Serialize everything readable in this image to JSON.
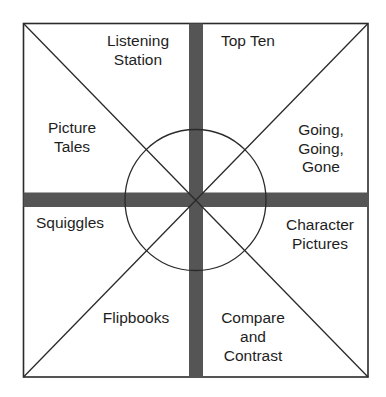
{
  "diagram": {
    "type": "activity-wheel",
    "colors": {
      "background": "#ffffff",
      "outline": "#2a2a2a",
      "cross_bar": "#555555",
      "text": "#1e1e1e"
    },
    "sections": [
      {
        "id": "top-left-upper",
        "lines": [
          "Listening",
          "Station"
        ]
      },
      {
        "id": "top-right-upper",
        "lines": [
          "Top Ten"
        ]
      },
      {
        "id": "top-left-lower",
        "lines": [
          "Picture",
          "Tales"
        ]
      },
      {
        "id": "top-right-lower",
        "lines": [
          "Going,",
          "Going,",
          "Gone"
        ]
      },
      {
        "id": "bottom-left-upper",
        "lines": [
          "Squiggles"
        ]
      },
      {
        "id": "bottom-right-upper",
        "lines": [
          "Character",
          "Pictures"
        ]
      },
      {
        "id": "bottom-left-lower",
        "lines": [
          "Flipbooks"
        ]
      },
      {
        "id": "bottom-right-lower",
        "lines": [
          "Compare",
          "and",
          "Contrast"
        ]
      }
    ]
  }
}
